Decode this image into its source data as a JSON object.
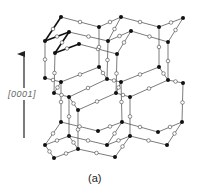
{
  "figure": {
    "axis_label": "[0001]",
    "caption": "(a)",
    "colors": {
      "bond": "#444444",
      "bond_highlight": "#111111",
      "atom_filled": "#111111",
      "atom_open_fill": "#ffffff",
      "atom_open_stroke": "#444444",
      "arrow": "#222222"
    },
    "arrow": {
      "x": 24,
      "y_start": 138,
      "y_end": 52
    },
    "filled_atoms": [
      [
        61,
        17
      ],
      [
        99,
        27
      ],
      [
        121,
        17
      ],
      [
        159,
        27
      ],
      [
        183,
        18
      ],
      [
        45,
        41
      ],
      [
        69,
        32
      ],
      [
        108,
        41
      ],
      [
        131,
        31
      ],
      [
        168,
        42
      ],
      [
        55,
        53
      ],
      [
        79,
        44
      ],
      [
        117,
        54
      ],
      [
        45,
        78
      ],
      [
        61,
        82
      ],
      [
        99,
        67
      ],
      [
        107,
        79
      ],
      [
        121,
        82
      ],
      [
        159,
        67
      ],
      [
        168,
        80
      ],
      [
        183,
        83
      ],
      [
        54,
        93
      ],
      [
        69,
        97
      ],
      [
        116,
        93
      ],
      [
        130,
        97
      ],
      [
        78,
        110
      ],
      [
        61,
        122
      ],
      [
        69,
        136
      ],
      [
        98,
        131
      ],
      [
        122,
        122
      ],
      [
        130,
        136
      ],
      [
        158,
        132
      ],
      [
        182,
        122
      ],
      [
        45,
        145
      ],
      [
        107,
        145
      ],
      [
        167,
        145
      ],
      [
        78,
        149
      ],
      [
        54,
        158
      ],
      [
        115,
        157
      ]
    ],
    "bonds": [
      [
        [
          61,
          17
        ],
        [
          99,
          27
        ]
      ],
      [
        [
          99,
          27
        ],
        [
          121,
          17
        ]
      ],
      [
        [
          121,
          17
        ],
        [
          159,
          27
        ]
      ],
      [
        [
          159,
          27
        ],
        [
          183,
          18
        ]
      ],
      [
        [
          69,
          32
        ],
        [
          108,
          41
        ]
      ],
      [
        [
          108,
          41
        ],
        [
          131,
          31
        ]
      ],
      [
        [
          131,
          31
        ],
        [
          168,
          42
        ]
      ],
      [
        [
          79,
          44
        ],
        [
          117,
          54
        ]
      ],
      [
        [
          183,
          18
        ],
        [
          168,
          42
        ]
      ],
      [
        [
          121,
          17
        ],
        [
          108,
          41
        ]
      ],
      [
        [
          131,
          31
        ],
        [
          117,
          54
        ]
      ],
      [
        [
          45,
          41
        ],
        [
          45,
          78
        ]
      ],
      [
        [
          55,
          53
        ],
        [
          54,
          93
        ]
      ],
      [
        [
          99,
          27
        ],
        [
          99,
          67
        ]
      ],
      [
        [
          108,
          41
        ],
        [
          107,
          79
        ]
      ],
      [
        [
          117,
          54
        ],
        [
          116,
          93
        ]
      ],
      [
        [
          159,
          27
        ],
        [
          159,
          67
        ]
      ],
      [
        [
          168,
          42
        ],
        [
          168,
          80
        ]
      ],
      [
        [
          45,
          78
        ],
        [
          61,
          82
        ]
      ],
      [
        [
          61,
          82
        ],
        [
          99,
          67
        ]
      ],
      [
        [
          99,
          67
        ],
        [
          107,
          79
        ]
      ],
      [
        [
          107,
          79
        ],
        [
          121,
          82
        ]
      ],
      [
        [
          121,
          82
        ],
        [
          159,
          67
        ]
      ],
      [
        [
          159,
          67
        ],
        [
          168,
          80
        ]
      ],
      [
        [
          168,
          80
        ],
        [
          183,
          83
        ]
      ],
      [
        [
          61,
          82
        ],
        [
          54,
          93
        ]
      ],
      [
        [
          54,
          93
        ],
        [
          69,
          97
        ]
      ],
      [
        [
          69,
          97
        ],
        [
          107,
          79
        ]
      ],
      [
        [
          121,
          82
        ],
        [
          116,
          93
        ]
      ],
      [
        [
          116,
          93
        ],
        [
          130,
          97
        ]
      ],
      [
        [
          130,
          97
        ],
        [
          168,
          80
        ]
      ],
      [
        [
          69,
          97
        ],
        [
          78,
          110
        ]
      ],
      [
        [
          78,
          110
        ],
        [
          116,
          93
        ]
      ],
      [
        [
          183,
          83
        ],
        [
          182,
          122
        ]
      ],
      [
        [
          130,
          97
        ],
        [
          130,
          136
        ]
      ],
      [
        [
          78,
          110
        ],
        [
          78,
          149
        ]
      ],
      [
        [
          69,
          97
        ],
        [
          69,
          136
        ]
      ],
      [
        [
          61,
          82
        ],
        [
          61,
          122
        ]
      ],
      [
        [
          121,
          82
        ],
        [
          122,
          122
        ]
      ],
      [
        [
          61,
          122
        ],
        [
          98,
          131
        ]
      ],
      [
        [
          98,
          131
        ],
        [
          122,
          122
        ]
      ],
      [
        [
          122,
          122
        ],
        [
          158,
          132
        ]
      ],
      [
        [
          158,
          132
        ],
        [
          182,
          122
        ]
      ],
      [
        [
          69,
          136
        ],
        [
          107,
          145
        ]
      ],
      [
        [
          107,
          145
        ],
        [
          130,
          136
        ]
      ],
      [
        [
          130,
          136
        ],
        [
          167,
          145
        ]
      ],
      [
        [
          167,
          145
        ],
        [
          182,
          122
        ]
      ],
      [
        [
          61,
          122
        ],
        [
          45,
          145
        ]
      ],
      [
        [
          45,
          145
        ],
        [
          69,
          136
        ]
      ],
      [
        [
          122,
          122
        ],
        [
          107,
          145
        ]
      ],
      [
        [
          69,
          136
        ],
        [
          78,
          149
        ]
      ],
      [
        [
          78,
          149
        ],
        [
          54,
          158
        ]
      ],
      [
        [
          78,
          149
        ],
        [
          115,
          157
        ]
      ],
      [
        [
          115,
          157
        ],
        [
          130,
          136
        ]
      ],
      [
        [
          54,
          158
        ],
        [
          45,
          145
        ]
      ]
    ],
    "highlight_bonds": [
      [
        [
          61,
          17
        ],
        [
          45,
          41
        ]
      ],
      [
        [
          45,
          41
        ],
        [
          69,
          32
        ]
      ],
      [
        [
          69,
          32
        ],
        [
          55,
          53
        ]
      ],
      [
        [
          55,
          53
        ],
        [
          79,
          44
        ]
      ]
    ]
  }
}
